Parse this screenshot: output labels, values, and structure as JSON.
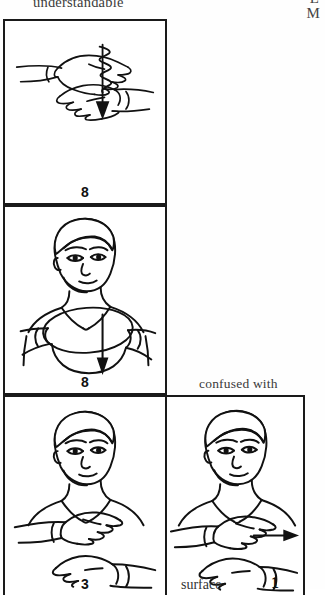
{
  "page": {
    "headword": "understandable",
    "corner_letter_top": "L",
    "corner_letter_bottom": "M",
    "confused_with_label": "confused with"
  },
  "entries": [
    {
      "id": "cell-1",
      "illustration": "two-flat-hands-stacked-with-wavy-down-arrow",
      "number": "8",
      "word": ""
    },
    {
      "id": "cell-2",
      "illustration": "person-hands-oval-chest-down-arrow",
      "number": "8",
      "word": ""
    },
    {
      "id": "cell-3",
      "illustration": "person-two-flat-hands-stacked",
      "number": "3",
      "word": ""
    },
    {
      "id": "cell-4",
      "illustration": "person-two-flat-hands-with-right-arrow",
      "number": "1",
      "word": "surface"
    }
  ],
  "colors": {
    "ink": "#1a1a1a",
    "paper": "#ffffff",
    "text": "#3a3a3a"
  }
}
